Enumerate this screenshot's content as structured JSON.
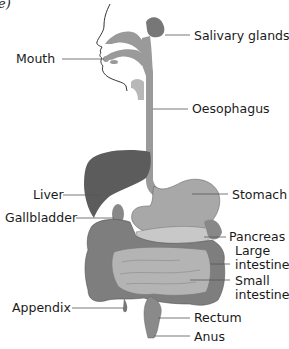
{
  "figure": {
    "corner_label": "e)",
    "labels": {
      "salivary_glands": "Salivary glands",
      "mouth": "Mouth",
      "oesophagus": "Oesophagus",
      "liver": "Liver",
      "stomach": "Stomach",
      "gallbladder": "Gallbladder",
      "pancreas": "Pancreas",
      "large_intestine_1": "Large",
      "large_intestine_2": "intestine",
      "small_intestine_1": "Small",
      "small_intestine_2": "intestine",
      "appendix": "Appendix",
      "rectum": "Rectum",
      "anus": "Anus"
    },
    "colors": {
      "background": "#ffffff",
      "organ_fill": "#9a9a9a",
      "liver_fill": "#5c5c5c",
      "stomach_fill": "#a8a8a8",
      "large_intestine_fill": "#7e7e7e",
      "small_intestine_fill": "#b4b4b4",
      "pancreas_fill": "#c8c8c8",
      "leader_line": "#555555",
      "text": "#1a1a1a"
    }
  }
}
